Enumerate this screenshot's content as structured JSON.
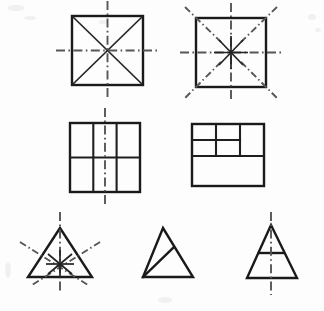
{
  "figure": {
    "background_color": "#fdfdfd",
    "outline_color": "#1a1a1a",
    "axis_color": "#565656",
    "canvas": {
      "width": 324,
      "height": 311
    }
  },
  "rows": [
    {
      "row_index": 1,
      "items": [
        {
          "id": "square-diagonals",
          "name": "square-with-two-diagonals-and-two-axes",
          "shape": "square",
          "bounds": {
            "x": 72,
            "y": 16,
            "width": 71,
            "height": 69
          },
          "internal_lines": 2,
          "internal_line_type": "diagonals",
          "symmetry_axes": 2,
          "axis_orientations": [
            "vertical",
            "horizontal"
          ]
        },
        {
          "id": "square-four-axes",
          "name": "square-with-four-symmetry-axes",
          "shape": "square",
          "bounds": {
            "x": 196,
            "y": 18,
            "width": 70,
            "height": 69
          },
          "internal_lines": 0,
          "symmetry_axes": 4,
          "axis_orientations": [
            "vertical",
            "horizontal",
            "diagonal-nw-se",
            "diagonal-ne-sw"
          ]
        }
      ]
    },
    {
      "row_index": 2,
      "items": [
        {
          "id": "square-grid-3x2",
          "name": "square-divided-into-three-columns-two-rows",
          "shape": "square",
          "bounds": {
            "x": 70,
            "y": 123,
            "width": 70,
            "height": 69
          },
          "columns": 3,
          "rows": 2,
          "symmetry_axes": 1,
          "axis_orientations": [
            "vertical"
          ]
        },
        {
          "id": "square-asymmetric",
          "name": "square-divided-asymmetrically",
          "shape": "square",
          "bounds": {
            "x": 192,
            "y": 124,
            "width": 72,
            "height": 62
          },
          "columns": 3,
          "rows": 3,
          "symmetry_axes": 0,
          "axis_orientations": []
        }
      ]
    },
    {
      "row_index": 3,
      "items": [
        {
          "id": "triangle-equilateral",
          "name": "equilateral-triangle-with-three-symmetry-axes",
          "shape": "equilateral-triangle",
          "vertices": [
            [
              60,
              228
            ],
            [
              28,
              277
            ],
            [
              92,
              277
            ]
          ],
          "symmetry_axes": 3,
          "axis_orientations": [
            "vertical",
            "median-left",
            "median-right"
          ]
        },
        {
          "id": "triangle-scalene",
          "name": "scalene-triangle-with-internal-line",
          "shape": "scalene-triangle",
          "vertices": [
            [
              163,
              228
            ],
            [
              143,
              277
            ],
            [
              193,
              277
            ]
          ],
          "internal_lines": 1,
          "symmetry_axes": 0,
          "axis_orientations": []
        },
        {
          "id": "triangle-isosceles",
          "name": "isosceles-triangle-with-horizontal-line-and-axis",
          "shape": "isosceles-triangle",
          "vertices": [
            [
              271,
              225
            ],
            [
              247,
              278
            ],
            [
              297,
              278
            ]
          ],
          "internal_lines": 1,
          "internal_line_type": "horizontal-chord",
          "symmetry_axes": 1,
          "axis_orientations": [
            "vertical"
          ]
        }
      ]
    }
  ],
  "legend": {
    "solid_line_meaning": "figure outline and internal subdivision",
    "dash_dot_line_meaning": "axis of symmetry"
  }
}
